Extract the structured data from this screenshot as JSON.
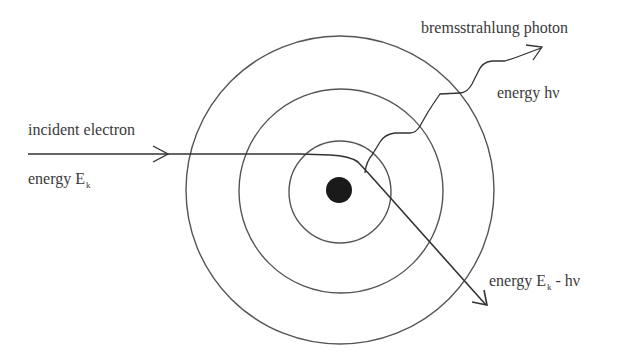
{
  "diagram": {
    "colors": {
      "line": "#333333",
      "orbit": "#555555",
      "nucleus": "#1a1a1a",
      "background": "#ffffff"
    },
    "nodes": {
      "nucleus": {
        "cx": 339,
        "cy": 190,
        "r": 13
      },
      "orbits": [
        {
          "name": "inner-shell",
          "cx": 340,
          "cy": 192,
          "r": 51
        },
        {
          "name": "middle-shell",
          "cx": 341,
          "cy": 191,
          "r": 102
        },
        {
          "name": "outer-shell",
          "cx": 340,
          "cy": 190,
          "r": 154
        }
      ]
    },
    "labels": {
      "incident": "incident electron",
      "incident_energy_prefix": "energy E",
      "incident_energy_sub": "k",
      "photon": "bremsstrahlung photon",
      "photon_energy": "energy hν",
      "scattered_energy_prefix": "energy E",
      "scattered_energy_sub": "k",
      "scattered_energy_suffix": " - hν"
    },
    "edges": [
      {
        "name": "incident-electron-path",
        "from": "left",
        "to": "near-nucleus",
        "arrow_at": [
          190,
          154
        ]
      },
      {
        "name": "scattered-electron-path",
        "from": "near-nucleus",
        "to": "lower-right",
        "arrow_at": [
          485,
          305
        ]
      },
      {
        "name": "bremsstrahlung-photon-path",
        "from": "near-nucleus",
        "to": "upper-right",
        "wavy": true,
        "arrow_at": [
          541,
          50
        ]
      }
    ]
  }
}
